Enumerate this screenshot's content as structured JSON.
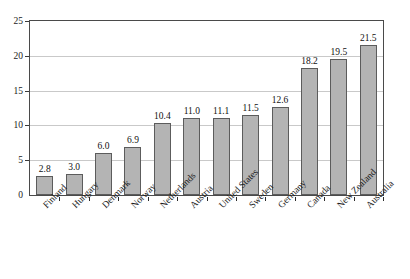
{
  "chart_data": {
    "type": "bar",
    "title": "",
    "subtitle": "",
    "xlabel": "",
    "ylabel": "",
    "ylim": [
      0,
      25
    ],
    "y_ticks": [
      0,
      5,
      10,
      15,
      20,
      25
    ],
    "y_tick_labels": [
      "0",
      "5",
      "10",
      "15",
      "20",
      "25"
    ],
    "grid": "horizontal",
    "legend": "none",
    "categories": [
      "Finland",
      "Hungary",
      "Denmark",
      "Norway",
      "Netherlands",
      "Austria",
      "United States",
      "Sweden",
      "Germany",
      "Canada",
      "New Zealand",
      "Australia"
    ],
    "values": [
      2.8,
      3.0,
      6.0,
      6.9,
      10.4,
      11.0,
      11.1,
      11.5,
      12.6,
      18.2,
      19.5,
      21.5
    ],
    "value_labels": [
      "2.8",
      "3.0",
      "6.0",
      "6.9",
      "10.4",
      "11.0",
      "11.1",
      "11.5",
      "12.6",
      "18.2",
      "19.5",
      "21.5"
    ],
    "bar_fill_color": "#b4b4b4",
    "bar_border_color": "#5c5c5c",
    "gridline_color": "#c9c9c9",
    "axis_color": "#4a4a4a",
    "background_color": "#ffffff"
  }
}
